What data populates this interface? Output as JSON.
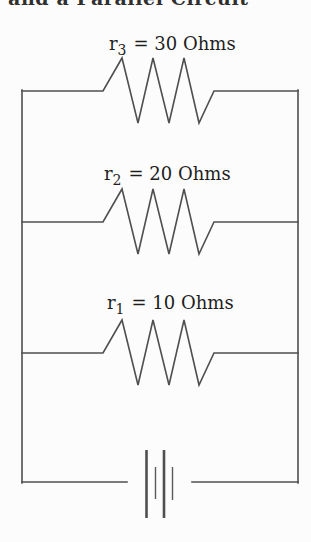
{
  "canvas": {
    "width": 311,
    "height": 542,
    "background": "#fcfcfc",
    "wire_color": "#4f4f4f",
    "text_color": "#1e1e1e"
  },
  "cropped_title": {
    "text": "and a Parallel Circuit",
    "note": "title line cut off at top edge of image"
  },
  "resistors": [
    {
      "symbol": "r",
      "subscript": "3",
      "value": "= 30 Ohms",
      "ohms": 30
    },
    {
      "symbol": "r",
      "subscript": "2",
      "value": "= 20 Ohms",
      "ohms": 20
    },
    {
      "symbol": "r",
      "subscript": "1",
      "value": "= 10 Ohms",
      "ohms": 10
    }
  ],
  "battery": {
    "kind": "battery-symbol",
    "cells": 2
  }
}
